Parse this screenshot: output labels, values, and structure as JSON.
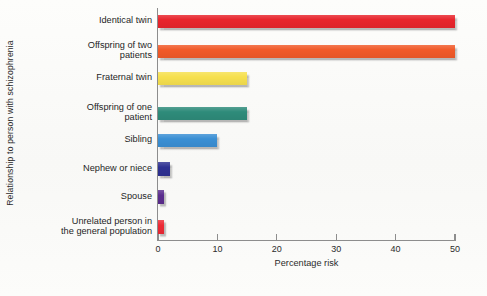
{
  "chart_data": {
    "type": "bar",
    "orientation": "horizontal",
    "title": "",
    "xlabel": "Percentage risk",
    "ylabel": "Relationship to person with schizophrenia",
    "xlim": [
      0,
      50
    ],
    "xticks": [
      0,
      10,
      20,
      30,
      40,
      50
    ],
    "xtick_labels": [
      "0",
      "10",
      "20",
      "30",
      "40",
      "50"
    ],
    "grid": false,
    "legend": false,
    "categories": [
      "Identical twin",
      "Offspring of two\npatients",
      "Fraternal twin",
      "Offspring of one\npatient",
      "Sibling",
      "Nephew or niece",
      "Spouse",
      "Unrelated person in\nthe general population"
    ],
    "values": [
      50,
      50,
      15,
      15,
      10,
      2,
      1,
      1
    ],
    "bar_colors": [
      "#e8252c",
      "#f15a29",
      "#f6e04e",
      "#2e8b7a",
      "#3a8fd4",
      "#2e3192",
      "#5b2d8e",
      "#ed2a35"
    ]
  },
  "axis": {
    "x_title": "Percentage risk",
    "y_title": "Relationship to person with schizophrenia"
  }
}
